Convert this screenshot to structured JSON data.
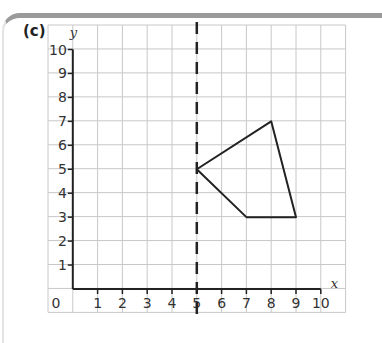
{
  "part_label": "(c)",
  "axes": {
    "x_name": "x",
    "y_name": "y",
    "origin_label": "0",
    "x_ticks": [
      "1",
      "2",
      "3",
      "4",
      "5",
      "6",
      "7",
      "8",
      "9",
      "10"
    ],
    "y_ticks": [
      "1",
      "2",
      "3",
      "4",
      "5",
      "6",
      "7",
      "8",
      "9",
      "10"
    ]
  },
  "mirror_line": {
    "equation": "x = 5",
    "style": "dashed"
  },
  "shape": {
    "vertices": [
      [
        5,
        5
      ],
      [
        8,
        7
      ],
      [
        9,
        3
      ],
      [
        7,
        3
      ]
    ]
  },
  "colors": {
    "grid": "#c8c8c8",
    "axis": "#222222",
    "shape": "#222222",
    "frame_top": "#9a9a9a"
  },
  "chart_data": {
    "type": "diagram",
    "title": "(c)",
    "xlabel": "x",
    "ylabel": "y",
    "xlim": [
      0,
      10
    ],
    "ylim": [
      0,
      10
    ],
    "grid": true,
    "mirror_line": "x = 5 (dashed)",
    "polygon": [
      [
        5,
        5
      ],
      [
        8,
        7
      ],
      [
        9,
        3
      ],
      [
        7,
        3
      ]
    ]
  }
}
